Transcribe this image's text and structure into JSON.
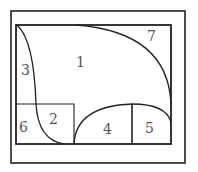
{
  "diagram": {
    "type": "region-partition",
    "stroke_color": "#222222",
    "label_color": "#555555",
    "regions": [
      {
        "id": "1",
        "label": "1"
      },
      {
        "id": "2",
        "label": "2"
      },
      {
        "id": "3",
        "label": "3"
      },
      {
        "id": "4",
        "label": "4"
      },
      {
        "id": "5",
        "label": "5"
      },
      {
        "id": "6",
        "label": "6"
      },
      {
        "id": "7",
        "label": "7"
      }
    ]
  }
}
